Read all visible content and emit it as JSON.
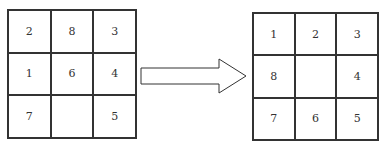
{
  "diagram": {
    "type": "8-puzzle state transition",
    "start_state": {
      "cells": [
        "2",
        "8",
        "3",
        "1",
        "6",
        "4",
        "7",
        "",
        "5"
      ]
    },
    "arrow": {
      "direction": "right",
      "style": "outlined block arrow"
    },
    "goal_state": {
      "cells": [
        "1",
        "2",
        "3",
        "8",
        "",
        "4",
        "7",
        "6",
        "5"
      ]
    }
  }
}
